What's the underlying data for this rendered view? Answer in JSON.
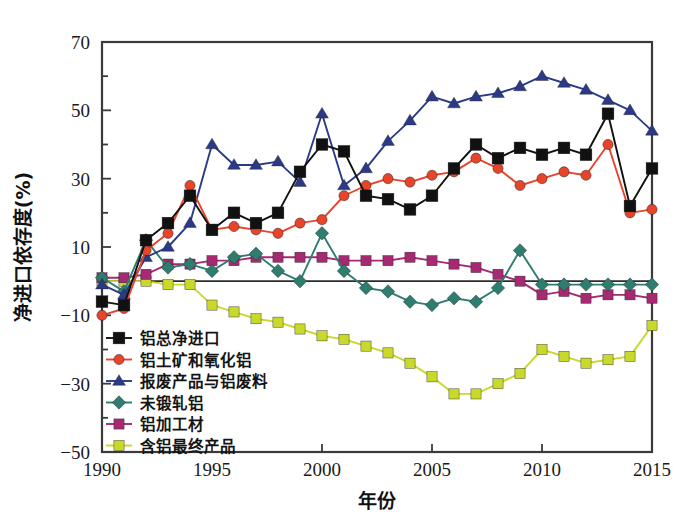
{
  "chart_data": {
    "type": "line",
    "title": "",
    "xlabel": "年份",
    "ylabel": "净进口依存度(%)",
    "xlim": [
      1990,
      2015
    ],
    "ylim": [
      -50,
      70
    ],
    "xticks": [
      1990,
      1995,
      2000,
      2005,
      2010,
      2015
    ],
    "yticks": [
      -50,
      -30,
      -10,
      10,
      30,
      50,
      70
    ],
    "yminorticks": [
      -40,
      -20,
      0,
      20,
      40,
      60
    ],
    "grid": false,
    "zero_line": true,
    "legend_position": "lower-left inside",
    "x": [
      1990,
      1991,
      1992,
      1993,
      1994,
      1995,
      1996,
      1997,
      1998,
      1999,
      2000,
      2001,
      2002,
      2003,
      2004,
      2005,
      2006,
      2007,
      2008,
      2009,
      2010,
      2011,
      2012,
      2013,
      2014,
      2015
    ],
    "series": [
      {
        "name": "铝总净进口",
        "color": "#111111",
        "marker": "square",
        "values": [
          -6,
          -7,
          12,
          17,
          25,
          15,
          20,
          17,
          20,
          32,
          40,
          38,
          25,
          24,
          21,
          25,
          33,
          40,
          36,
          39,
          37,
          39,
          37,
          49,
          22,
          33
        ]
      },
      {
        "name": "铝土矿和氧化铝",
        "color": "#E8442A",
        "marker": "circle",
        "values": [
          -10,
          -8,
          9,
          14,
          28,
          15,
          16,
          15,
          14,
          17,
          18,
          25,
          28,
          30,
          29,
          31,
          32,
          36,
          33,
          28,
          30,
          32,
          31,
          40,
          20,
          21
        ]
      },
      {
        "name": "报废产品与铝废料",
        "color": "#2B3A87",
        "marker": "triangle",
        "values": [
          -1,
          -4,
          7,
          10,
          17,
          40,
          34,
          34,
          35,
          29,
          49,
          28,
          33,
          41,
          47,
          54,
          52,
          54,
          55,
          57,
          60,
          58,
          56,
          53,
          50,
          44
        ]
      },
      {
        "name": "未锻轧铝",
        "color": "#2E7D6E",
        "marker": "diamond",
        "values": [
          1,
          -3,
          12,
          4,
          5,
          3,
          7,
          8,
          3,
          0,
          14,
          3,
          -2,
          -3,
          -6,
          -7,
          -5,
          -6,
          -2,
          9,
          -1,
          -1,
          -1,
          -1,
          -1,
          -1
        ]
      },
      {
        "name": "铝加工材",
        "color": "#A52A72",
        "marker": "square",
        "values": [
          1,
          1,
          2,
          5,
          5,
          6,
          6,
          7,
          7,
          7,
          7,
          6,
          6,
          6,
          7,
          6,
          5,
          4,
          2,
          0,
          -4,
          -3,
          -5,
          -4,
          -4,
          -5
        ]
      },
      {
        "name": "含铝最终产品",
        "color": "#C9D92B",
        "marker": "square",
        "values": [
          0,
          0,
          0,
          -1,
          -1,
          -7,
          -9,
          -11,
          -12,
          -14,
          -16,
          -17,
          -19,
          -21,
          -24,
          -28,
          -33,
          -33,
          -30,
          -27,
          -20,
          -22,
          -24,
          -23,
          -22,
          -13
        ]
      }
    ]
  }
}
